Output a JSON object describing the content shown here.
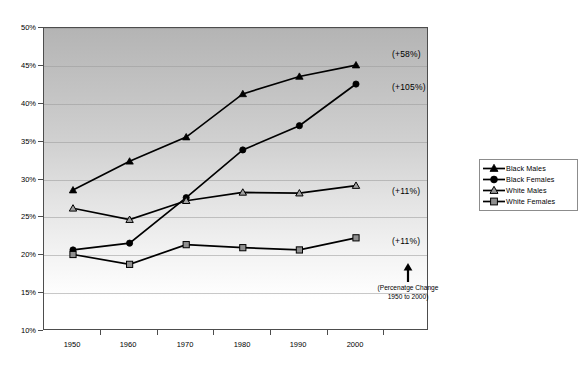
{
  "chart_data": {
    "type": "line",
    "title": "",
    "xlabel": "",
    "ylabel": "",
    "x": [
      "1950",
      "1960",
      "1970",
      "1980",
      "1990",
      "2000"
    ],
    "categories": [
      "1950",
      "1960",
      "1970",
      "1980",
      "1990",
      "2000"
    ],
    "ylim": [
      10,
      50
    ],
    "ytick_labels": [
      "10%",
      "15%",
      "20%",
      "25%",
      "30%",
      "35%",
      "40%",
      "45%",
      "50%"
    ],
    "ytick_values": [
      10,
      15,
      20,
      25,
      30,
      35,
      40,
      45,
      50
    ],
    "grid": true,
    "legend_position": "right",
    "series": [
      {
        "name": "Black Males",
        "marker": "filled-triangle",
        "color": "#000000",
        "values": [
          28.6,
          32.4,
          35.6,
          41.3,
          43.6,
          45.1
        ],
        "change_label": "(+58%)"
      },
      {
        "name": "Black Females",
        "marker": "filled-circle",
        "color": "#000000",
        "values": [
          20.7,
          21.6,
          27.6,
          33.9,
          37.1,
          42.6
        ],
        "change_label": "(+105%)"
      },
      {
        "name": "White Males",
        "marker": "open-triangle",
        "color": "#000000",
        "values": [
          26.2,
          24.7,
          27.2,
          28.3,
          28.2,
          29.2
        ],
        "change_label": "(+11%)"
      },
      {
        "name": "White Females",
        "marker": "open-square",
        "color": "#000000",
        "values": [
          20.1,
          18.8,
          21.4,
          21.0,
          20.7,
          22.3
        ],
        "change_label": "(+11%)"
      }
    ],
    "annotations": [
      {
        "text": "(+58%)",
        "series": "Black Males"
      },
      {
        "text": "(+105%)",
        "series": "Black Females"
      },
      {
        "text": "(+11%)",
        "series": "White Males"
      },
      {
        "text": "(+11%)",
        "series": "White Females"
      }
    ],
    "footnote": {
      "line1": "(Percenatge Change",
      "line2": "1950 to 2000)",
      "arrow": "up-arrow-icon"
    }
  },
  "legend": {
    "items": [
      {
        "label": "Black Males"
      },
      {
        "label": "Black Females"
      },
      {
        "label": "White Males"
      },
      {
        "label": "White Females"
      }
    ]
  }
}
